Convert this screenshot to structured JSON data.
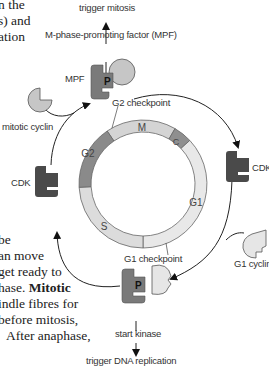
{
  "body_text": {
    "top_lines": [
      "n the",
      "s) and",
      "ation"
    ],
    "bottom_lines": [
      "be",
      "an move",
      " get ready to",
      "hase.",
      "Mitotic",
      "indle fibres for",
      "before mitosis,",
      "After anaphase,"
    ]
  },
  "diagram": {
    "top_output": "trigger mitosis",
    "mpf_full": "M-phase-promoting factor (MPF)",
    "mpf_label": "MPF",
    "mpf_phospho": "P",
    "mitotic_cyclin": "mitotic cyclin",
    "cdk_left": "CDK",
    "cdk_right": "CDK",
    "g1_cyclin": "G1 cyclin",
    "g2_checkpoint": "G2 checkpoint",
    "g1_checkpoint": "G1 checkpoint",
    "start_kinase": "start kinase",
    "start_phospho": "P",
    "bottom_output": "trigger DNA replication",
    "phases": [
      {
        "name": "M",
        "color": "#d4d4d4"
      },
      {
        "name": "C",
        "color": "#8f8f8f"
      },
      {
        "name": "G1",
        "color": "#e8e8e8"
      },
      {
        "name": "S",
        "color": "#dcdcdc"
      },
      {
        "name": "G2",
        "color": "#8a8a8a"
      }
    ],
    "colors": {
      "cdk_dark": "#4a4a4a",
      "mpf_cdk": "#7a7a7a",
      "cyclin_fill": "#c8c8c8",
      "g1_cyclin_fill": "#e6e6e6"
    }
  }
}
